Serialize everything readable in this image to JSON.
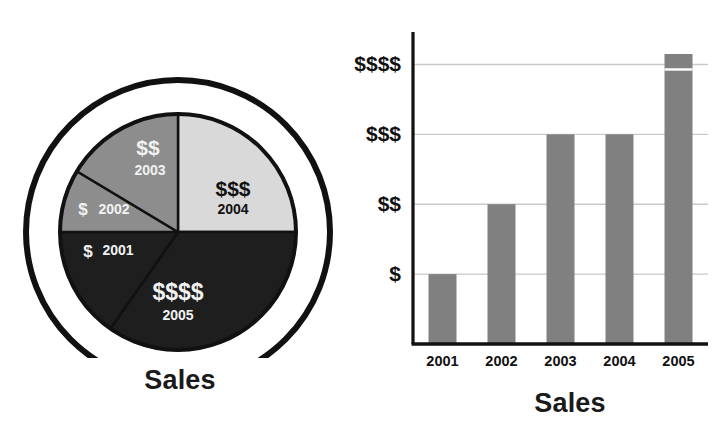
{
  "chart_data": [
    {
      "type": "pie",
      "title": "Sales",
      "caption": "Sales",
      "categories": [
        "2004",
        "2005",
        "2001",
        "2002",
        "2003"
      ],
      "values": [
        3,
        4,
        1,
        1,
        2
      ],
      "value_labels": [
        "$$$",
        "$$$$",
        "$",
        "$",
        "$$"
      ],
      "slices": [
        {
          "year": "2004",
          "value_label": "$$$",
          "value": 3,
          "start_angle": 0,
          "end_angle": 90,
          "fill": "#d9d9d9",
          "text_color": "#111111",
          "label_x": 233,
          "label_y": 196,
          "year_x": 233,
          "year_y": 214,
          "value_font_size": 21,
          "year_font_size": 14
        },
        {
          "year": "2005",
          "value_label": "$$$$",
          "value": 4,
          "start_angle": 90,
          "end_angle": 215,
          "fill": "#1e1e1e",
          "text_color": "#f2f2f2",
          "label_x": 178,
          "label_y": 300,
          "year_x": 178,
          "year_y": 320,
          "value_font_size": 23,
          "year_font_size": 14
        },
        {
          "year": "2001",
          "value_label": "$",
          "value": 1,
          "start_angle": 215,
          "end_angle": 270,
          "fill": "#1e1e1e",
          "text_color": "#f2f2f2",
          "label_x": 88,
          "label_y": 257,
          "year_x": 118,
          "year_y": 255,
          "value_font_size": 17,
          "year_font_size": 14
        },
        {
          "year": "2002",
          "value_label": "$",
          "value": 1,
          "start_angle": 270,
          "end_angle": 301,
          "fill": "#8d8d8d",
          "text_color": "#f2f2f2",
          "label_x": 83,
          "label_y": 215,
          "year_x": 114,
          "year_y": 214,
          "value_font_size": 17,
          "year_font_size": 14
        },
        {
          "year": "2003",
          "value_label": "$$",
          "value": 2,
          "start_angle": 301,
          "end_angle": 360,
          "fill": "#8d8d8d",
          "text_color": "#f2f2f2",
          "label_x": 148,
          "label_y": 155,
          "year_x": 150,
          "year_y": 175,
          "value_font_size": 21,
          "year_font_size": 14
        }
      ],
      "geometry": {
        "cx": 178,
        "cy": 232,
        "pie_radius": 118,
        "inner_white_ring_radius": 133,
        "outer_ring_radius": 152,
        "pie_stroke": "#111111",
        "pie_stroke_width": 4,
        "outer_ring_stroke": "#111111",
        "outer_ring_stroke_width": 6
      }
    },
    {
      "type": "bar",
      "title": "Sales",
      "caption": "Sales",
      "xlabel": "",
      "ylabel": "",
      "categories": [
        "2001",
        "2002",
        "2003",
        "2004",
        "2005"
      ],
      "values": [
        1,
        2,
        3,
        3,
        4.15
      ],
      "tick_labels": [
        "$",
        "$$",
        "$$$",
        "$$$$"
      ],
      "tick_values": [
        1,
        2,
        3,
        4
      ],
      "ylim": [
        0,
        4.35
      ],
      "grid": true,
      "legend": "none",
      "bar_color": "#808080",
      "axis_color": "#111111",
      "grid_color": "#c9c9c9",
      "bars": [
        {
          "category": "2001",
          "value": 1,
          "label": "$"
        },
        {
          "category": "2002",
          "value": 2,
          "label": "$$"
        },
        {
          "category": "2003",
          "value": 3,
          "label": "$$$"
        },
        {
          "category": "2004",
          "value": 3,
          "label": "$$$"
        },
        {
          "category": "2005",
          "value": 4.15,
          "label": "$$$$"
        }
      ]
    }
  ],
  "pie": {
    "caption": "Sales"
  },
  "bar": {
    "caption": "Sales"
  }
}
